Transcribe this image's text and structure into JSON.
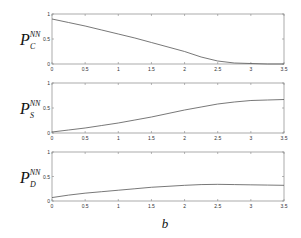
{
  "chart_data": [
    {
      "type": "line",
      "panel": "top",
      "ylabel_main": "P",
      "ylabel_sub": "C",
      "ylabel_sup": "NN",
      "x": [
        0,
        0.25,
        0.5,
        0.75,
        1.0,
        1.25,
        1.5,
        1.75,
        2.0,
        2.25,
        2.5,
        2.75,
        3.0,
        3.25,
        3.5
      ],
      "values": [
        0.9,
        0.83,
        0.76,
        0.68,
        0.6,
        0.52,
        0.43,
        0.34,
        0.25,
        0.14,
        0.06,
        0.02,
        0.01,
        0.0,
        0.0
      ],
      "xlim": [
        0,
        3.5
      ],
      "ylim": [
        0,
        1
      ],
      "xticks": [
        "0",
        "0.5",
        "1",
        "1.5",
        "2",
        "2.5",
        "3",
        "3.5"
      ],
      "yticks": [
        "0",
        "0.5",
        "1"
      ],
      "grid": false
    },
    {
      "type": "line",
      "panel": "middle",
      "ylabel_main": "P",
      "ylabel_sub": "S",
      "ylabel_sup": "NN",
      "x": [
        0,
        0.25,
        0.5,
        0.75,
        1.0,
        1.25,
        1.5,
        1.75,
        2.0,
        2.25,
        2.5,
        2.75,
        3.0,
        3.25,
        3.5
      ],
      "values": [
        0.02,
        0.06,
        0.1,
        0.15,
        0.2,
        0.26,
        0.32,
        0.39,
        0.46,
        0.52,
        0.58,
        0.62,
        0.65,
        0.66,
        0.67
      ],
      "xlim": [
        0,
        3.5
      ],
      "ylim": [
        0,
        1
      ],
      "xticks": [
        "0",
        "0.5",
        "1",
        "1.5",
        "2",
        "2.5",
        "3",
        "3.5"
      ],
      "yticks": [
        "0",
        "0.5",
        "1"
      ],
      "grid": false
    },
    {
      "type": "line",
      "panel": "bottom",
      "ylabel_main": "P",
      "ylabel_sub": "D",
      "ylabel_sup": "NN",
      "x": [
        0,
        0.25,
        0.5,
        0.75,
        1.0,
        1.25,
        1.5,
        1.75,
        2.0,
        2.25,
        2.5,
        2.75,
        3.0,
        3.25,
        3.5
      ],
      "values": [
        0.07,
        0.12,
        0.16,
        0.19,
        0.22,
        0.25,
        0.28,
        0.3,
        0.32,
        0.335,
        0.34,
        0.335,
        0.33,
        0.325,
        0.32
      ],
      "xlim": [
        0,
        3.5
      ],
      "ylim": [
        0,
        1
      ],
      "xticks": [
        "0",
        "0.5",
        "1",
        "1.5",
        "2",
        "2.5",
        "3",
        "3.5"
      ],
      "yticks": [
        "0",
        "0.5",
        "1"
      ],
      "grid": false
    }
  ],
  "xlabel": "b",
  "colors": {
    "line": "#555555",
    "axes": "#888888",
    "text": "#333333"
  }
}
